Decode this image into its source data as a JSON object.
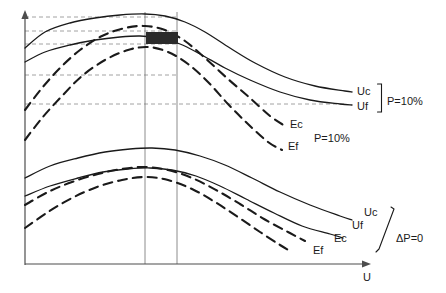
{
  "chart_data": {
    "type": "line",
    "title": "",
    "xlabel": "U",
    "ylabel": "",
    "grid": "horizontal-dashed-reference-lines",
    "legend": "inline-curve-end-labels",
    "axes": {
      "x_axis_label": "U",
      "x_axis_arrow": true,
      "y_axis_arrow": true,
      "x_ticks": [],
      "y_ticks": []
    },
    "groups": [
      {
        "name": "P=10%",
        "condition_label": "P=10%",
        "series": [
          {
            "name": "Uc",
            "label": "Uc",
            "style": "solid",
            "points": [
              [
                25,
                48
              ],
              [
                45,
                32
              ],
              [
                70,
                23
              ],
              [
                95,
                18
              ],
              [
                120,
                15
              ],
              [
                145,
                14
              ],
              [
                165,
                16
              ],
              [
                185,
                22
              ],
              [
                205,
                32
              ],
              [
                230,
                48
              ],
              [
                255,
                63
              ],
              [
                285,
                77
              ],
              [
                315,
                86
              ],
              [
                345,
                91
              ],
              [
                352,
                92
              ]
            ]
          },
          {
            "name": "Uf",
            "label": "Uf",
            "style": "solid",
            "points": [
              [
                25,
                62
              ],
              [
                45,
                52
              ],
              [
                70,
                45
              ],
              [
                95,
                40
              ],
              [
                120,
                37
              ],
              [
                140,
                36
              ],
              [
                160,
                38
              ],
              [
                180,
                44
              ],
              [
                200,
                54
              ],
              [
                225,
                68
              ],
              [
                250,
                80
              ],
              [
                280,
                92
              ],
              [
                310,
                100
              ],
              [
                340,
                104
              ],
              [
                352,
                105
              ]
            ]
          },
          {
            "name": "Ec",
            "label": "Ec",
            "style": "dashed",
            "points": [
              [
                25,
                110
              ],
              [
                42,
                88
              ],
              [
                60,
                68
              ],
              [
                80,
                50
              ],
              [
                102,
                36
              ],
              [
                125,
                28
              ],
              [
                145,
                26
              ],
              [
                165,
                30
              ],
              [
                185,
                41
              ],
              [
                205,
                58
              ],
              [
                228,
                79
              ],
              [
                250,
                98
              ],
              [
                270,
                116
              ],
              [
                285,
                126
              ]
            ]
          },
          {
            "name": "Ef",
            "label": "Ef",
            "style": "dashed",
            "points": [
              [
                25,
                140
              ],
              [
                42,
                118
              ],
              [
                62,
                96
              ],
              [
                82,
                76
              ],
              [
                105,
                60
              ],
              [
                128,
                50
              ],
              [
                148,
                47
              ],
              [
                168,
                52
              ],
              [
                188,
                64
              ],
              [
                208,
                82
              ],
              [
                228,
                104
              ],
              [
                248,
                124
              ],
              [
                268,
                142
              ],
              [
                282,
                150
              ]
            ]
          }
        ]
      },
      {
        "name": "dP=0",
        "condition_label": "ΔP=0",
        "series": [
          {
            "name": "Uc",
            "label": "Uc",
            "style": "solid",
            "points": [
              [
                25,
                178
              ],
              [
                50,
                166
              ],
              [
                78,
                158
              ],
              [
                105,
                152
              ],
              [
                130,
                149
              ],
              [
                152,
                148
              ],
              [
                175,
                150
              ],
              [
                200,
                156
              ],
              [
                225,
                165
              ],
              [
                252,
                178
              ],
              [
                280,
                192
              ],
              [
                310,
                205
              ],
              [
                340,
                216
              ],
              [
                352,
                220
              ]
            ]
          },
          {
            "name": "Uf",
            "label": "Uf",
            "style": "solid",
            "points": [
              [
                25,
                196
              ],
              [
                50,
                186
              ],
              [
                78,
                178
              ],
              [
                103,
                172
              ],
              [
                128,
                169
              ],
              [
                150,
                168
              ],
              [
                172,
                170
              ],
              [
                196,
                176
              ],
              [
                220,
                186
              ],
              [
                246,
                199
              ],
              [
                274,
                213
              ],
              [
                302,
                226
              ],
              [
                330,
                234
              ],
              [
                343,
                238
              ]
            ]
          },
          {
            "name": "Ec",
            "label": "Ec",
            "style": "dashed",
            "points": [
              [
                25,
                205
              ],
              [
                48,
                192
              ],
              [
                72,
                182
              ],
              [
                98,
                174
              ],
              [
                122,
                169
              ],
              [
                145,
                167
              ],
              [
                168,
                170
              ],
              [
                192,
                178
              ],
              [
                216,
                190
              ],
              [
                240,
                204
              ],
              [
                264,
                219
              ],
              [
                288,
                232
              ],
              [
                305,
                241
              ]
            ]
          },
          {
            "name": "Ef",
            "label": "Ef",
            "style": "dashed",
            "points": [
              [
                25,
                228
              ],
              [
                48,
                212
              ],
              [
                72,
                198
              ],
              [
                97,
                187
              ],
              [
                122,
                180
              ],
              [
                145,
                177
              ],
              [
                168,
                180
              ],
              [
                192,
                189
              ],
              [
                215,
                202
              ],
              [
                238,
                217
              ],
              [
                260,
                232
              ],
              [
                280,
                245
              ],
              [
                292,
                252
              ]
            ]
          }
        ]
      }
    ],
    "reference_lines": {
      "horizontal_dashed": [
        {
          "y": 17,
          "x_from": 25,
          "x_to": 178
        },
        {
          "y": 31,
          "x_from": 25,
          "x_to": 178
        },
        {
          "y": 44,
          "x_from": 25,
          "x_to": 178
        },
        {
          "y": 75,
          "x_from": 25,
          "x_to": 178
        },
        {
          "y": 104,
          "x_from": 25,
          "x_to": 345
        }
      ],
      "vertical_solid": [
        {
          "x": 145,
          "y_from": 12,
          "y_to": 264
        },
        {
          "x": 177,
          "y_from": 12,
          "y_to": 264
        }
      ]
    },
    "annotations": [
      {
        "type": "redaction-block",
        "x": 146,
        "y": 32,
        "width": 32,
        "height": 12,
        "color": "#2b2b2b"
      }
    ]
  },
  "figure": {
    "axis": {
      "x_label": "U",
      "y_label": ""
    },
    "labels": {
      "upper_uc": "Uc",
      "upper_uf": "Uf",
      "upper_ec": "Ec",
      "upper_ef": "Ef",
      "upper_bracket_condition": "P=10%",
      "upper_ecef_condition": "P=10%",
      "lower_uc": "Uc",
      "lower_uf": "Uf",
      "lower_ec": "Ec",
      "lower_ef": "Ef",
      "lower_bracket_condition": "ΔP=0"
    }
  },
  "colors": {
    "curve": "#1a1a1a",
    "reference_line": "#8c8c8c",
    "vertical_line": "#6e6e6e",
    "axis": "#4d4d4d",
    "redaction": "#2b2b2b",
    "background": "#ffffff"
  }
}
